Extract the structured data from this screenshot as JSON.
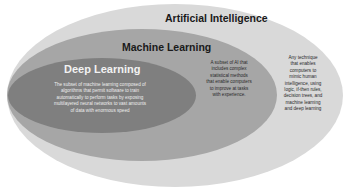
{
  "diagram": {
    "type": "nested-ellipse",
    "colors": {
      "background": "#ffffff",
      "artificial_intelligence": "#d9d9d9",
      "machine_learning": "#a6a6a6",
      "deep_learning": "#7f7f7f"
    },
    "artificial_intelligence": {
      "title": "Artificial Intelligence",
      "description_lines": [
        "Any technique",
        "that enables",
        "computers to",
        "mimic human",
        "intelligence, using",
        "logic, if-then rules,",
        "decision trees, and",
        "machine learning",
        "and deep learning"
      ]
    },
    "machine_learning": {
      "title": "Machine Learning",
      "description_lines": [
        "A subset of AI that",
        "includes complex",
        "statistical methods",
        "that enable computers",
        "to improve at tasks",
        "with experience."
      ]
    },
    "deep_learning": {
      "title": "Deep Learning",
      "description_lines": [
        "The subset of machine learning composed of",
        "algorithms that permit software to train",
        "automatically to perform tasks by exposing",
        "multilayered neural networks to vast amounts",
        "of data with enormous speed"
      ]
    }
  }
}
